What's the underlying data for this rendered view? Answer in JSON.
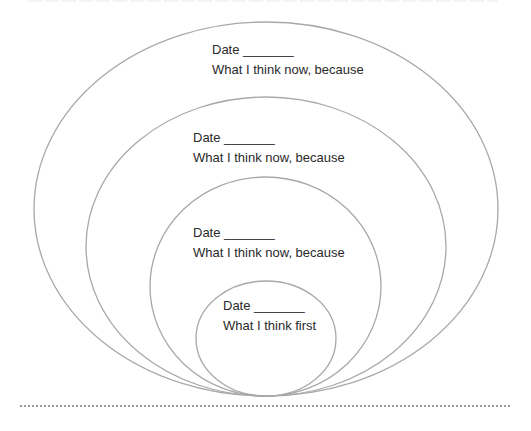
{
  "diagram": {
    "type": "nested-ellipses",
    "stroke_color": "#a8a8a8",
    "rings": [
      {
        "id": "outer",
        "date_label": "Date _______",
        "text": "What I think now, because"
      },
      {
        "id": "second",
        "date_label": "Date _______",
        "text": "What I think now, because"
      },
      {
        "id": "third",
        "date_label": "Date _______",
        "text": "What I think now, because"
      },
      {
        "id": "inner",
        "date_label": "Date _______",
        "text": "What I think first"
      }
    ]
  }
}
